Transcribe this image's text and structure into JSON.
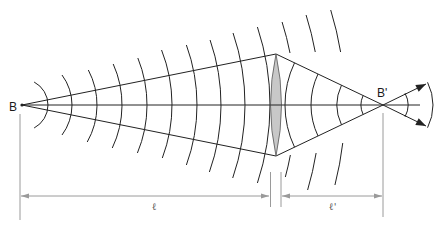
{
  "figure": {
    "labels": {
      "source": "B",
      "image": "B'",
      "object_distance": "ℓ",
      "image_distance": "ℓ'"
    },
    "colors": {
      "line": "#222222",
      "dimension": "#9a9a9a",
      "lens_fill": "#c8c8c8",
      "lens_stroke": "#555555",
      "background": "#ffffff"
    },
    "geometry": {
      "source_point": [
        22,
        105
      ],
      "image_point": [
        383,
        105
      ],
      "lens": {
        "x": 276,
        "top": 54,
        "bottom": 156,
        "half_width": 5.5
      },
      "diverging_arcs": [
        [
          26,
          82,
          128
        ],
        [
          50,
          75,
          135
        ],
        [
          75,
          70,
          142
        ],
        [
          100,
          64,
          148
        ],
        [
          125,
          58,
          153
        ],
        [
          150,
          50,
          158
        ],
        [
          175,
          45,
          165
        ],
        [
          199,
          40,
          172
        ],
        [
          223,
          33,
          178
        ],
        [
          248,
          27,
          183
        ]
      ],
      "outer_arcs_top": [
        [
          273,
          22,
          53
        ],
        [
          298,
          15,
          52
        ],
        [
          323,
          10,
          52
        ]
      ],
      "outer_arcs_bottom": [
        [
          273,
          155,
          177
        ],
        [
          298,
          153,
          190
        ],
        [
          323,
          143,
          185
        ]
      ],
      "converging_arcs": [
        98,
        72,
        46,
        22
      ],
      "after_focus_arcs": [
        {
          "r": 25,
          "half_angle_deg": 28
        },
        {
          "r": 50,
          "half_angle_deg": 27
        }
      ],
      "ray_tips": [
        [
          426,
          84
        ],
        [
          426,
          126
        ]
      ],
      "axis_end_x": 420,
      "dimension": {
        "y": 196,
        "extension_lines": [
          [
            20,
            114,
            220
          ],
          [
            270.5,
            172,
            207
          ],
          [
            281,
            172,
            207
          ],
          [
            383,
            113,
            217
          ]
        ],
        "spans": [
          [
            21,
            269
          ],
          [
            282,
            382
          ]
        ]
      }
    }
  }
}
